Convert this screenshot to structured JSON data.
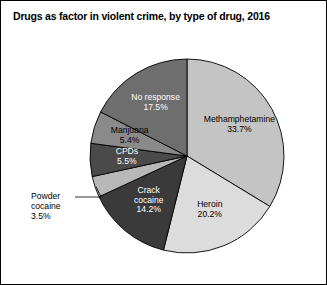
{
  "figure": {
    "title": "Drugs as factor in violent crime, by type of drug, 2016",
    "border_color": "#000000",
    "background": "#ffffff"
  },
  "chart_data": {
    "type": "pie",
    "title": "Drugs as factor in violent crime, by type of drug, 2016",
    "xlabel": "",
    "ylabel": "",
    "units": "percent",
    "start_angle_deg": 0,
    "direction": "clockwise",
    "legend": "none",
    "grid": false,
    "categories": [
      "Methamphetamine",
      "Heroin",
      "Crack cocaine",
      "Powder cocaine",
      "CPDs",
      "Marijuana",
      "No response"
    ],
    "values": [
      33.7,
      20.2,
      14.2,
      3.5,
      5.5,
      5.4,
      17.5
    ],
    "slices": [
      {
        "name": "Methamphetamine",
        "label": "Methamphetamine",
        "value": 33.7,
        "value_label": "33.7%",
        "color": "#c4c4c4",
        "text_color": "#000000",
        "label_placement": "inside"
      },
      {
        "name": "Heroin",
        "label": "Heroin",
        "value": 20.2,
        "value_label": "20.2%",
        "color": "#dcdcdc",
        "text_color": "#000000",
        "label_placement": "inside"
      },
      {
        "name": "Crack cocaine",
        "label": "Crack",
        "label_line2": "cocaine",
        "value": 14.2,
        "value_label": "14.2%",
        "color": "#3a3a3a",
        "text_color": "#ffffff",
        "label_placement": "inside"
      },
      {
        "name": "Powder cocaine",
        "label": "Powder",
        "label_line2": "cocaine",
        "value": 3.5,
        "value_label": "3.5%",
        "color": "#b8b8b8",
        "text_color": "#000000",
        "label_placement": "outside-left-leader"
      },
      {
        "name": "CPDs",
        "label": "CPDs",
        "value": 5.5,
        "value_label": "5.5%",
        "color": "#4a4a4a",
        "text_color": "#ffffff",
        "label_placement": "inside"
      },
      {
        "name": "Marijuana",
        "label": "Marijuana",
        "value": 5.4,
        "value_label": "5.4%",
        "color": "#8a8a8a",
        "text_color": "#000000",
        "label_placement": "inside"
      },
      {
        "name": "No response",
        "label": "No response",
        "value": 17.5,
        "value_label": "17.5%",
        "color": "#6e6e6e",
        "text_color": "#ffffff",
        "label_placement": "inside"
      }
    ]
  }
}
